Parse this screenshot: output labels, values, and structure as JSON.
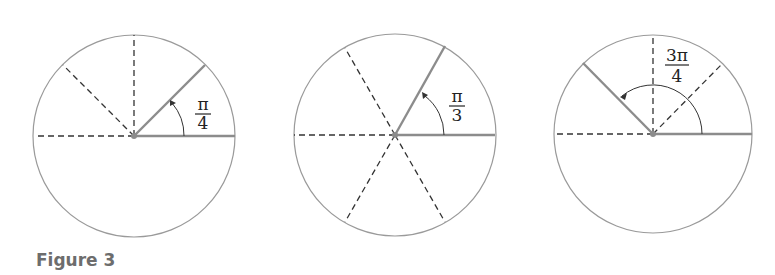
{
  "caption": "Figure 3",
  "colors": {
    "circle": "#9a9a9a",
    "ray": "#8c8c8c",
    "dash": "#333333",
    "arc": "#333333",
    "text": "#222222",
    "caption": "#6d6d6d"
  },
  "figures": [
    {
      "label_num": "π",
      "label_den": "4",
      "angle": "π/4",
      "dashed_deg": [
        90,
        135,
        180
      ]
    },
    {
      "label_num": "π",
      "label_den": "3",
      "angle": "π/3",
      "dashed_deg": [
        120,
        180,
        240,
        300
      ]
    },
    {
      "label_num": "3π",
      "label_den": "4",
      "angle": "3π/4",
      "dashed_deg": [
        45,
        90,
        180
      ]
    }
  ]
}
